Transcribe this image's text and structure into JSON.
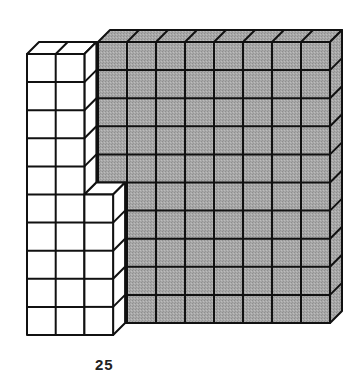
{
  "figure": {
    "gray_block": {
      "columns": 8,
      "rows": 10,
      "fill": "#a6a6a6"
    },
    "white_block": {
      "tall_columns": 2,
      "tall_rows": 10,
      "short_columns": 1,
      "short_rows": 5,
      "fill": "#ffffff"
    },
    "stroke": "#111111",
    "caption": "25"
  }
}
